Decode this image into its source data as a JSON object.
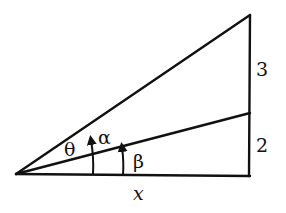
{
  "diagram": {
    "type": "geometry",
    "labels": {
      "theta": "θ",
      "alpha": "α",
      "beta": "β",
      "base": "x",
      "upper_segment": "3",
      "lower_segment": "2"
    },
    "segments": {
      "upper_vertical": 3,
      "lower_vertical": 2,
      "base": "x"
    },
    "angles": [
      "θ",
      "α",
      "β"
    ]
  }
}
